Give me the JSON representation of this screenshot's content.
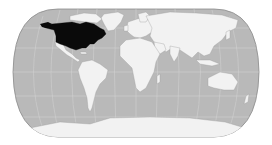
{
  "map": {
    "type": "world-locator-map",
    "projection": "pseudo-cylindrical (Eckert IV-like)",
    "highlighted_region": "Northern North America (United States and Canada)",
    "colors": {
      "background": "#ffffff",
      "ocean": "#b9b9b9",
      "land": "#f2f2f2",
      "highlight": "#0a0a0a",
      "graticule": "#d4d4d4",
      "outline": "#8a8a8a",
      "coast": "#9a9a9a"
    }
  }
}
